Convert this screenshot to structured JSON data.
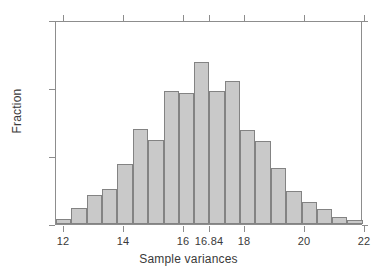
{
  "chart_data": {
    "type": "bar",
    "title": "",
    "subtitle": "",
    "xlabel": "Sample variances",
    "ylabel": "Fraction",
    "xlim": [
      11.74,
      21.93
    ],
    "ylim": [
      0,
      0.15
    ],
    "grid": false,
    "legend": null,
    "xticks": [
      12,
      14,
      16,
      16.84,
      18,
      20,
      22
    ],
    "xticklabels": [
      "12",
      "14",
      "16",
      "16.84",
      "18",
      "20",
      "22"
    ],
    "yticks": [
      0,
      0.05,
      0.1,
      0.15
    ],
    "yticklabels": [
      "0",
      ".05",
      ".1",
      ".15"
    ],
    "bin_width": 0.5095,
    "bin_starts": [
      11.74,
      12.25,
      12.76,
      13.27,
      13.78,
      14.29,
      14.8,
      15.31,
      15.81,
      16.32,
      16.83,
      17.34,
      17.85,
      18.36,
      18.87,
      19.38,
      19.89,
      20.4,
      20.9,
      21.41
    ],
    "bin_centers": [
      11.99,
      12.5,
      13.01,
      13.52,
      14.04,
      14.55,
      15.06,
      15.56,
      16.07,
      16.58,
      17.09,
      17.6,
      18.11,
      18.61,
      19.12,
      19.63,
      20.14,
      20.65,
      21.16,
      21.67
    ],
    "categories": [
      "11.99",
      "12.50",
      "13.01",
      "13.52",
      "14.04",
      "14.55",
      "15.06",
      "15.56",
      "16.07",
      "16.58",
      "17.09",
      "17.60",
      "18.11",
      "18.61",
      "19.12",
      "19.63",
      "20.14",
      "20.65",
      "21.16",
      "21.67"
    ],
    "values": [
      0.004,
      0.012,
      0.021,
      0.026,
      0.044,
      0.07,
      0.062,
      0.098,
      0.096,
      0.119,
      0.098,
      0.105,
      0.069,
      0.061,
      0.041,
      0.024,
      0.016,
      0.011,
      0.005,
      0.003
    ],
    "bar_fill_color": "#c9c9c9",
    "bar_edge_color": "#838383",
    "axis_color": "#8d8d8d",
    "text_color": "#3a3a3a",
    "background_color": "#ffffff"
  }
}
